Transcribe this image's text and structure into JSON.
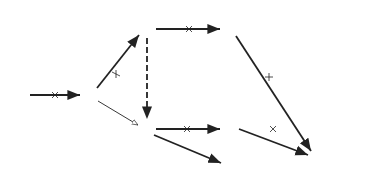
{
  "diagram": {
    "type": "activity-network",
    "nodes": [
      {
        "id": "1",
        "label": "1",
        "x": 21,
        "y": 95
      },
      {
        "id": "2",
        "label": "2",
        "x": 90,
        "y": 95
      },
      {
        "id": "3",
        "label": "3",
        "x": 147,
        "y": 29
      },
      {
        "id": "4",
        "label": "4",
        "x": 147,
        "y": 129
      },
      {
        "id": "5",
        "label": "5",
        "x": 230,
        "y": 29
      },
      {
        "id": "6",
        "label": "6",
        "x": 230,
        "y": 129
      },
      {
        "id": "7",
        "label": "7",
        "x": 230,
        "y": 167
      },
      {
        "id": "8",
        "label": "8",
        "x": 318,
        "y": 158
      }
    ],
    "edges": [
      {
        "from": "1",
        "to": "2",
        "label": "4",
        "style": "critical",
        "mark": "cross"
      },
      {
        "from": "2",
        "to": "3",
        "label": "5",
        "style": "critical",
        "mark": "tick"
      },
      {
        "from": "2",
        "to": "4",
        "label": "3",
        "style": "thin",
        "mark": "none"
      },
      {
        "from": "3",
        "to": "4",
        "label": "",
        "style": "dummy-dashed",
        "mark": "none"
      },
      {
        "from": "3",
        "to": "5",
        "label": "5",
        "style": "critical",
        "mark": "cross"
      },
      {
        "from": "5",
        "to": "8",
        "label": "1",
        "style": "critical",
        "mark": "tick"
      },
      {
        "from": "4",
        "to": "6",
        "label": "3",
        "style": "critical",
        "mark": "cross"
      },
      {
        "from": "6",
        "to": "8",
        "label": "3",
        "style": "critical",
        "mark": "cross"
      },
      {
        "from": "4",
        "to": "7",
        "label": "2",
        "style": "critical",
        "mark": "none"
      },
      {
        "from": "7",
        "to": "8",
        "label": "4",
        "style": "critical",
        "mark": "none"
      }
    ],
    "annotations": {
      "node4_tf": "TF2",
      "node4_ff": "FF2",
      "tp_symbol": "T",
      "tp_sup": "C",
      "tp_sub": "P",
      "tp_value": "= 15",
      "cp_symbol": "C",
      "cp_sup": "C",
      "cp_sub": "P",
      "cp_value": "= 1615"
    }
  }
}
